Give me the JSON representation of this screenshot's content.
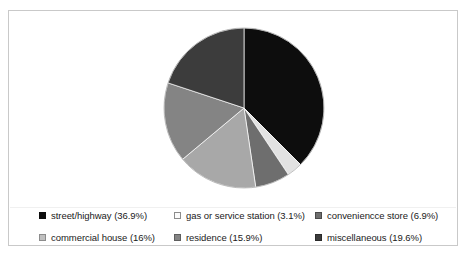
{
  "chart_data": {
    "type": "pie",
    "title": "",
    "start_angle_deg": 0,
    "direction": "clockwise",
    "legend_position": "bottom",
    "legend_columns": 3,
    "legend_rows": 2,
    "grid": false,
    "categories": [
      "street/highway",
      "gas or service station",
      "conveniencce store",
      "commercial house",
      "residence",
      "miscellaneous"
    ],
    "values": [
      36.9,
      3.1,
      6.9,
      16,
      15.9,
      19.6
    ],
    "value_labels": [
      "36.9%",
      "3.1%",
      "6.9%",
      "16%",
      "15.9%",
      "19.6%"
    ],
    "colors": [
      "#0d0d0d",
      "#e2e2e2",
      "#6e6e6e",
      "#a8a8a8",
      "#848484",
      "#3c3c3c"
    ],
    "slice_order_clockwise": [
      "street/highway",
      "gas or service station",
      "conveniencce store",
      "commercial house",
      "residence",
      "miscellaneous"
    ]
  },
  "legend": {
    "entries": [
      {
        "label": "street/highway (36.9%)",
        "swatch": "#0d0d0d",
        "swatch_border": "#0d0d0d",
        "name": "street-highway"
      },
      {
        "label": "gas or service station (3.1%)",
        "swatch": "#fbfbfb",
        "swatch_border": "#8c8c8c",
        "name": "gas-or-service-station"
      },
      {
        "label": "conveniencce store (6.9%)",
        "swatch": "#6e6e6e",
        "swatch_border": "#4a4a4a",
        "name": "conveniencce-store"
      },
      {
        "label": "commercial house (16%)",
        "swatch": "#c0c0c0",
        "swatch_border": "#8c8c8c",
        "name": "commercial-house"
      },
      {
        "label": "residence (15.9%)",
        "swatch": "#848484",
        "swatch_border": "#5e5e5e",
        "name": "residence"
      },
      {
        "label": "miscellaneous (19.6%)",
        "swatch": "#3c3c3c",
        "swatch_border": "#2a2a2a",
        "name": "miscellaneous"
      }
    ]
  },
  "figure": {
    "border_color": "#c9c9c9",
    "background": "#ffffff"
  }
}
